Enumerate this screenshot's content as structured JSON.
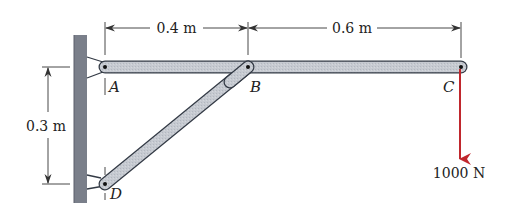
{
  "diagram": {
    "type": "structural-frame",
    "dimensions": {
      "ab_length": "0.4 m",
      "bc_length": "0.6 m",
      "ad_height": "0.3 m"
    },
    "points": {
      "A": "A",
      "B": "B",
      "C": "C",
      "D": "D"
    },
    "load": {
      "label": "1000 N",
      "direction": "down",
      "color": "#c0272d"
    },
    "colors": {
      "wall": "#7a7f8a",
      "member_fill": "#c9cdd3",
      "member_stroke": "#333a45",
      "dimension": "#333333",
      "force": "#c0272d"
    }
  }
}
